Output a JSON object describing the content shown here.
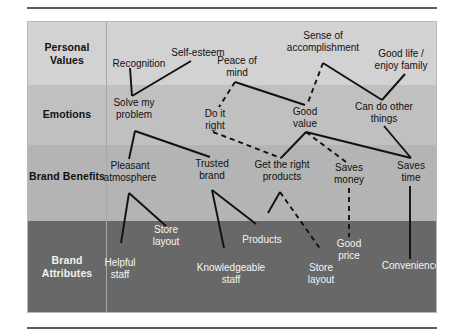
{
  "diagram": {
    "type": "means-end-chain-ladder",
    "rows": [
      {
        "id": "personal-values",
        "label": "Personal\nValues",
        "band_color": "#d2d2d2",
        "text_color": "#111111"
      },
      {
        "id": "emotions",
        "label": "Emotions",
        "band_color": "#c0c0c0",
        "text_color": "#111111"
      },
      {
        "id": "brand-benefits",
        "label": "Brand\nBenefits",
        "band_color": "#b4b4b4",
        "text_color": "#111111"
      },
      {
        "id": "brand-attributes",
        "label": "Brand\nAttributes",
        "band_color": "#686868",
        "text_color": "#f2f2f2"
      }
    ],
    "nodes": {
      "personal_values": [
        {
          "id": "recognition",
          "label": "Recognition"
        },
        {
          "id": "self-esteem",
          "label": "Self-esteem"
        },
        {
          "id": "peace-of-mind",
          "label": "Peace of\nmind"
        },
        {
          "id": "sense-of-accomplishment",
          "label": "Sense of\naccomplishment"
        },
        {
          "id": "good-life-enjoy-family",
          "label": "Good life /\nenjoy family"
        }
      ],
      "emotions": [
        {
          "id": "solve-my-problem",
          "label": "Solve my\nproblem"
        },
        {
          "id": "do-it-right",
          "label": "Do it\nright"
        },
        {
          "id": "good-value",
          "label": "Good\nvalue"
        },
        {
          "id": "can-do-other-things",
          "label": "Can do other\nthings"
        }
      ],
      "brand_benefits": [
        {
          "id": "pleasant-atmosphere",
          "label": "Pleasant\natmosphere"
        },
        {
          "id": "trusted-brand",
          "label": "Trusted\nbrand"
        },
        {
          "id": "get-the-right-products",
          "label": "Get the right\nproducts"
        },
        {
          "id": "saves-money",
          "label": "Saves\nmoney"
        },
        {
          "id": "saves-time",
          "label": "Saves\ntime"
        }
      ],
      "brand_attributes": [
        {
          "id": "store-layout-left",
          "label": "Store\nlayout"
        },
        {
          "id": "products",
          "label": "Products"
        },
        {
          "id": "good-price",
          "label": "Good\nprice"
        },
        {
          "id": "helpful-staff",
          "label": "Helpful\nstaff"
        },
        {
          "id": "knowledgeable-staff",
          "label": "Knowledgeable\nstaff"
        },
        {
          "id": "store-layout-right",
          "label": "Store\nlayout"
        },
        {
          "id": "convenience",
          "label": "Convenience"
        }
      ]
    },
    "links": [
      {
        "from": "recognition",
        "to": "solve-my-problem",
        "style": "solid"
      },
      {
        "from": "self-esteem",
        "to": "solve-my-problem",
        "style": "solid"
      },
      {
        "from": "peace-of-mind",
        "to": "do-it-right",
        "style": "dashed"
      },
      {
        "from": "peace-of-mind",
        "to": "good-value",
        "style": "solid"
      },
      {
        "from": "sense-of-accomplishment",
        "to": "good-value",
        "style": "dashed"
      },
      {
        "from": "sense-of-accomplishment",
        "to": "can-do-other-things",
        "style": "solid"
      },
      {
        "from": "good-life-enjoy-family",
        "to": "can-do-other-things",
        "style": "solid"
      },
      {
        "from": "solve-my-problem",
        "to": "pleasant-atmosphere",
        "style": "solid"
      },
      {
        "from": "solve-my-problem",
        "to": "trusted-brand",
        "style": "solid"
      },
      {
        "from": "do-it-right",
        "to": "get-the-right-products",
        "style": "dashed"
      },
      {
        "from": "good-value",
        "to": "get-the-right-products",
        "style": "solid"
      },
      {
        "from": "good-value",
        "to": "saves-money",
        "style": "dashed"
      },
      {
        "from": "good-value",
        "to": "saves-time",
        "style": "solid"
      },
      {
        "from": "can-do-other-things",
        "to": "saves-time",
        "style": "solid"
      },
      {
        "from": "pleasant-atmosphere",
        "to": "helpful-staff",
        "style": "solid"
      },
      {
        "from": "pleasant-atmosphere",
        "to": "store-layout-left",
        "style": "solid"
      },
      {
        "from": "trusted-brand",
        "to": "knowledgeable-staff",
        "style": "solid"
      },
      {
        "from": "trusted-brand",
        "to": "products",
        "style": "solid"
      },
      {
        "from": "get-the-right-products",
        "to": "products",
        "style": "solid"
      },
      {
        "from": "get-the-right-products",
        "to": "store-layout-right",
        "style": "dashed"
      },
      {
        "from": "saves-money",
        "to": "good-price",
        "style": "dashed"
      },
      {
        "from": "saves-time",
        "to": "convenience",
        "style": "solid"
      }
    ]
  }
}
